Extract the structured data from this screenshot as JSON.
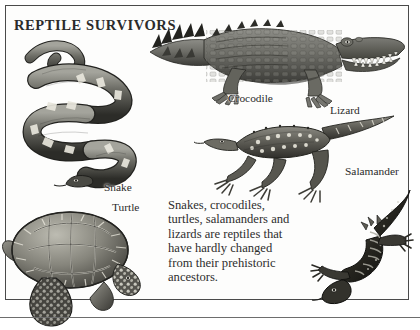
{
  "page": {
    "title": "REPTILE SURVIVORS",
    "body_text": "Snakes, crocodiles, turtles, salamanders and lizards are reptiles that have hardly changed from their prehistoric ancestors.",
    "frame_color": "#4a4a4a",
    "background_color": "#fdfdfc",
    "ink_color": "#2b2b2b"
  },
  "labels": {
    "crocodile": "Crocodile",
    "lizard": "Lizard",
    "salamander": "Salamander",
    "snake": "Snake",
    "turtle": "Turtle"
  },
  "figures": [
    {
      "name": "crocodile",
      "label": "Crocodile",
      "style": "grayscale-engraving"
    },
    {
      "name": "snake",
      "label": "Snake",
      "style": "grayscale-engraving"
    },
    {
      "name": "turtle",
      "label": "Turtle",
      "style": "grayscale-engraving"
    },
    {
      "name": "lizard",
      "label": "Lizard",
      "style": "grayscale-engraving"
    },
    {
      "name": "salamander",
      "label": "Salamander",
      "style": "grayscale-engraving"
    }
  ]
}
